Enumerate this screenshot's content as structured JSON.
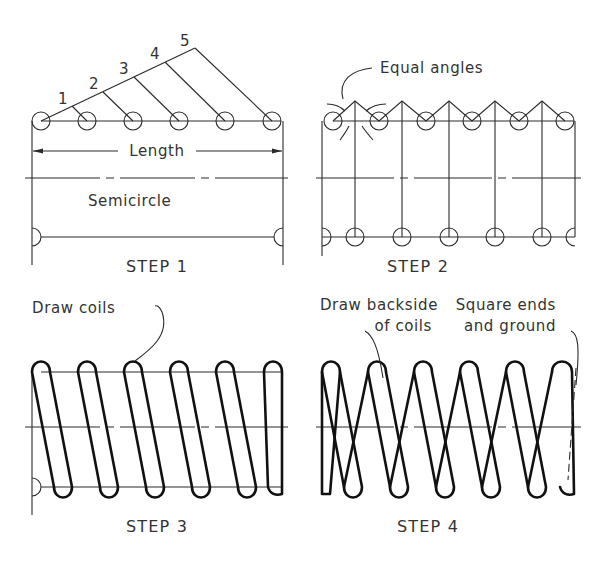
{
  "figure": {
    "panels": [
      {
        "id": "step1",
        "caption": "STEP 1",
        "labels": {
          "length": "Length",
          "semicircle": "Semicircle"
        },
        "division_numbers": [
          "1",
          "2",
          "3",
          "4",
          "5"
        ]
      },
      {
        "id": "step2",
        "caption": "STEP 2",
        "labels": {
          "callout": "Equal angles"
        }
      },
      {
        "id": "step3",
        "caption": "STEP 3",
        "labels": {
          "callout": "Draw coils"
        }
      },
      {
        "id": "step4",
        "caption": "STEP 4",
        "labels": {
          "callout_backside_line1": "Draw backside",
          "callout_backside_line2": "of coils",
          "callout_ends_line1": "Square ends",
          "callout_ends_line2": "and ground"
        }
      }
    ],
    "colors": {
      "line": "#111111",
      "text": "#333333",
      "background": "#ffffff"
    }
  }
}
